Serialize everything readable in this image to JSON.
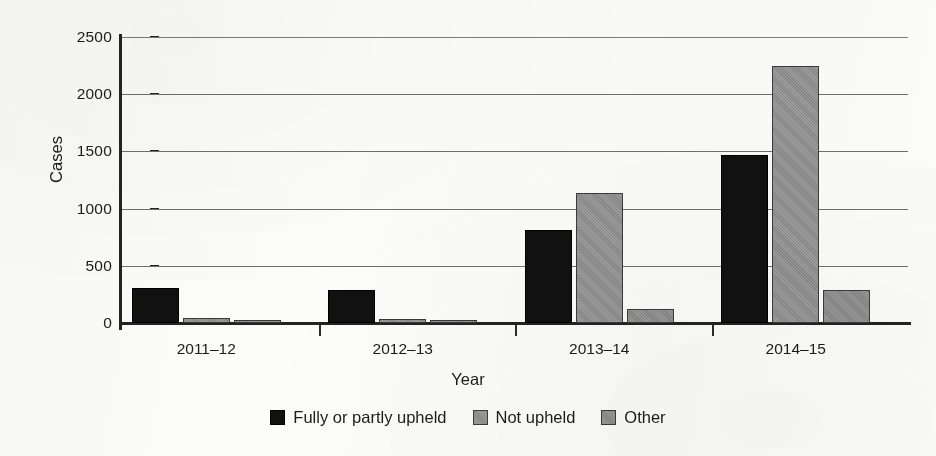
{
  "chart_data": {
    "type": "bar",
    "title": "",
    "xlabel": "Year",
    "ylabel": "Cases",
    "categories": [
      "2011–12",
      "2012–13",
      "2013–14",
      "2014–15"
    ],
    "series": [
      {
        "name": "Fully or partly upheld",
        "color": "#111111",
        "values": [
          310,
          285,
          815,
          1465
        ]
      },
      {
        "name": "Not upheld",
        "color": "#8d8d8d",
        "values": [
          40,
          35,
          1140,
          2245
        ]
      },
      {
        "name": "Other",
        "color": "#8a8a8a",
        "values": [
          20,
          15,
          120,
          290
        ]
      }
    ],
    "ylim": [
      0,
      2500
    ],
    "yticks": [
      0,
      500,
      1000,
      1500,
      2000,
      2500
    ],
    "ytick_labels": [
      "0",
      "500",
      "1000",
      "1500",
      "2000",
      "2500"
    ],
    "grid": true,
    "legend_position": "bottom"
  },
  "axes": {
    "y_title": "Cases",
    "x_title": "Year"
  }
}
